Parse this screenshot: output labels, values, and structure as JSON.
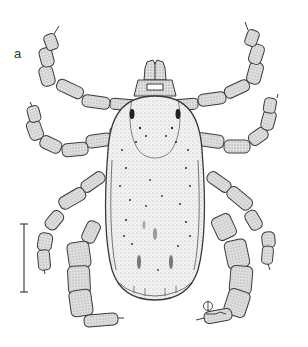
{
  "figure": {
    "panel_label": "a",
    "signature": "artist monogram",
    "colors": {
      "ink": "#3a3a3a",
      "fill": "#e6e6e6",
      "background": "#ffffff"
    }
  }
}
